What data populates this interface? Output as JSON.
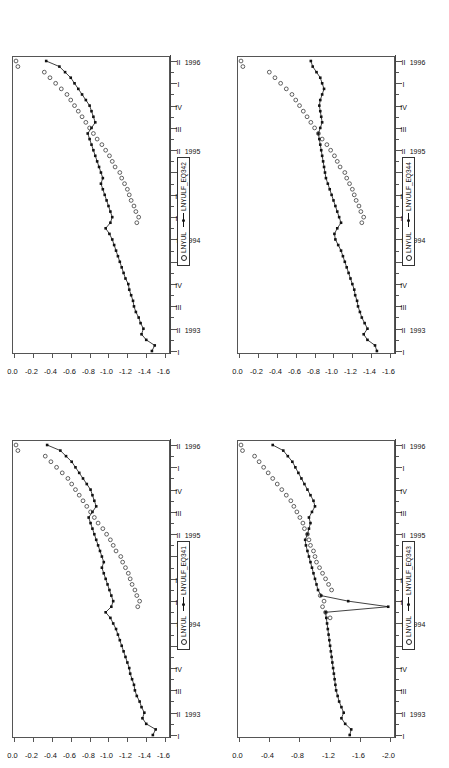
{
  "figure": {
    "background": "#ffffff",
    "panel_count": 4,
    "orientation": "rotated-90-ccw",
    "frame_color": "#555555"
  },
  "legend": {
    "series_observed": "LNYUL",
    "marker_observed": "open-circle",
    "marker_fitted": "line-with-filled-square"
  },
  "axis": {
    "x_quarters": [
      "I",
      "II",
      "III",
      "IV"
    ],
    "x_years": [
      "1993",
      "1994",
      "1995",
      "1996"
    ],
    "x_tick_labels": [
      "I",
      "II",
      "III",
      "IV",
      "I",
      "II",
      "III",
      "IV",
      "I",
      "II",
      "III",
      "IV",
      "I",
      "II"
    ],
    "x_year_positions": [
      1,
      5,
      9,
      13
    ]
  },
  "chart_data": [
    {
      "id": "panel-top-left",
      "type": "line",
      "title": "",
      "fitted_name": "LNYULF_EQ342",
      "observed_name": "LNYUL",
      "xlabel": "",
      "ylabel": "",
      "ylim": [
        -1.6,
        0.0
      ],
      "yticks": [
        "0.0",
        "-0.2",
        "-0.4",
        "-0.6",
        "-0.8",
        "-1.0",
        "-1.2",
        "-1.4",
        "-1.6"
      ],
      "ytick_values": [
        0.0,
        -0.2,
        -0.4,
        -0.6,
        -0.8,
        -1.0,
        -1.2,
        -1.4,
        -1.6
      ],
      "grid": false,
      "legend_position": "bottom-center",
      "x": [
        "1993Q1",
        "1993Q2",
        "1993Q3",
        "1993Q4",
        "1994Q1",
        "1994Q2",
        "1994Q3",
        "1994Q4",
        "1995Q1",
        "1995Q2",
        "1995Q3",
        "1995Q4",
        "1996Q1",
        "1996Q2"
      ],
      "n_points": 53,
      "series": [
        {
          "name": "LNYULF_EQ342",
          "marker": "filled-square-line",
          "values": [
            -1.44,
            -1.47,
            -1.38,
            -1.33,
            -1.35,
            -1.32,
            -1.3,
            -1.27,
            -1.25,
            -1.24,
            -1.22,
            -1.2,
            -1.19,
            -1.16,
            -1.14,
            -1.12,
            -1.1,
            -1.08,
            -1.06,
            -1.04,
            -1.02,
            -0.99,
            -0.95,
            -1.0,
            -1.02,
            -1.0,
            -0.98,
            -0.96,
            -0.94,
            -0.92,
            -0.9,
            -0.92,
            -0.9,
            -0.88,
            -0.86,
            -0.84,
            -0.82,
            -0.8,
            -0.78,
            -0.76,
            -0.8,
            -0.84,
            -0.82,
            -0.8,
            -0.78,
            -0.74,
            -0.7,
            -0.66,
            -0.62,
            -0.58,
            -0.52,
            -0.46,
            -0.32
          ]
        },
        {
          "name": "LNYUL",
          "marker": "open-circle",
          "values": [
            null,
            null,
            null,
            null,
            null,
            null,
            null,
            null,
            null,
            null,
            null,
            null,
            null,
            null,
            null,
            null,
            null,
            null,
            null,
            null,
            null,
            null,
            null,
            -1.28,
            -1.3,
            -1.27,
            -1.25,
            -1.22,
            -1.2,
            -1.18,
            -1.15,
            -1.12,
            -1.1,
            -1.05,
            -1.02,
            -0.99,
            -0.95,
            -0.91,
            -0.86,
            -0.82,
            -0.78,
            -0.74,
            -0.7,
            -0.66,
            -0.62,
            -0.58,
            -0.54,
            -0.48,
            -0.42,
            -0.36,
            -0.3,
            -0.02,
            0.0
          ]
        }
      ]
    },
    {
      "id": "panel-bottom-left",
      "type": "line",
      "title": "",
      "fitted_name": "LNYULF_EQ341",
      "observed_name": "LNYUL",
      "xlabel": "",
      "ylabel": "",
      "ylim": [
        -1.6,
        0.0
      ],
      "yticks": [
        "0.0",
        "-0.2",
        "-0.4",
        "-0.6",
        "-0.8",
        "-1.0",
        "-1.2",
        "-1.4",
        "-1.6"
      ],
      "ytick_values": [
        0.0,
        -0.2,
        -0.4,
        -0.6,
        -0.8,
        -1.0,
        -1.2,
        -1.4,
        -1.6
      ],
      "grid": false,
      "legend_position": "bottom-center",
      "n_points": 53,
      "series": [
        {
          "name": "LNYULF_EQ341",
          "marker": "filled-square-line",
          "values": [
            -1.45,
            -1.48,
            -1.38,
            -1.34,
            -1.36,
            -1.33,
            -1.31,
            -1.28,
            -1.26,
            -1.25,
            -1.23,
            -1.21,
            -1.2,
            -1.18,
            -1.16,
            -1.14,
            -1.12,
            -1.1,
            -1.08,
            -1.06,
            -1.03,
            -1.0,
            -0.95,
            -1.01,
            -1.03,
            -1.01,
            -0.99,
            -0.97,
            -0.95,
            -0.93,
            -0.91,
            -0.93,
            -0.91,
            -0.89,
            -0.87,
            -0.85,
            -0.83,
            -0.81,
            -0.79,
            -0.77,
            -0.81,
            -0.85,
            -0.83,
            -0.81,
            -0.79,
            -0.75,
            -0.71,
            -0.67,
            -0.63,
            -0.59,
            -0.53,
            -0.47,
            -0.33
          ]
        },
        {
          "name": "LNYUL",
          "marker": "open-circle",
          "values": [
            null,
            null,
            null,
            null,
            null,
            null,
            null,
            null,
            null,
            null,
            null,
            null,
            null,
            null,
            null,
            null,
            null,
            null,
            null,
            null,
            null,
            null,
            null,
            -1.29,
            -1.31,
            -1.28,
            -1.26,
            -1.23,
            -1.21,
            -1.19,
            -1.16,
            -1.13,
            -1.11,
            -1.06,
            -1.03,
            -1.0,
            -0.96,
            -0.92,
            -0.87,
            -0.83,
            -0.79,
            -0.75,
            -0.71,
            -0.67,
            -0.63,
            -0.59,
            -0.55,
            -0.49,
            -0.43,
            -0.37,
            -0.31,
            -0.02,
            0.0
          ]
        }
      ]
    },
    {
      "id": "panel-top-right",
      "type": "line",
      "title": "",
      "fitted_name": "LNYULF_EQ344",
      "observed_name": "LNYUL",
      "xlabel": "",
      "ylabel": "",
      "ylim": [
        -1.6,
        0.0
      ],
      "yticks": [
        "0.0",
        "-0.2",
        "-0.4",
        "-0.6",
        "-0.8",
        "-1.0",
        "-1.2",
        "-1.4",
        "-1.6"
      ],
      "ytick_values": [
        0.0,
        -0.2,
        -0.4,
        -0.6,
        -0.8,
        -1.0,
        -1.2,
        -1.4,
        -1.6
      ],
      "grid": false,
      "legend_position": "bottom-center",
      "n_points": 53,
      "series": [
        {
          "name": "LNYULF_EQ344",
          "marker": "filled-square-line",
          "values": [
            -1.44,
            -1.42,
            -1.34,
            -1.3,
            -1.34,
            -1.31,
            -1.28,
            -1.26,
            -1.24,
            -1.23,
            -1.21,
            -1.2,
            -1.18,
            -1.16,
            -1.14,
            -1.12,
            -1.1,
            -1.08,
            -1.06,
            -1.03,
            -1.0,
            -0.99,
            -1.02,
            -1.06,
            -1.04,
            -1.02,
            -1.0,
            -0.98,
            -0.96,
            -0.94,
            -0.92,
            -0.9,
            -0.89,
            -0.88,
            -0.87,
            -0.86,
            -0.85,
            -0.84,
            -0.83,
            -0.82,
            -0.84,
            -0.86,
            -0.85,
            -0.84,
            -0.83,
            -0.84,
            -0.86,
            -0.88,
            -0.86,
            -0.84,
            -0.8,
            -0.76,
            -0.74
          ]
        },
        {
          "name": "LNYUL",
          "marker": "open-circle",
          "values": [
            null,
            null,
            null,
            null,
            null,
            null,
            null,
            null,
            null,
            null,
            null,
            null,
            null,
            null,
            null,
            null,
            null,
            null,
            null,
            null,
            null,
            null,
            null,
            -1.28,
            -1.3,
            -1.27,
            -1.25,
            -1.22,
            -1.2,
            -1.18,
            -1.15,
            -1.12,
            -1.1,
            -1.05,
            -1.02,
            -0.99,
            -0.95,
            -0.91,
            -0.86,
            -0.82,
            -0.78,
            -0.74,
            -0.7,
            -0.66,
            -0.62,
            -0.58,
            -0.54,
            -0.48,
            -0.42,
            -0.36,
            -0.3,
            -0.02,
            0.0
          ]
        }
      ]
    },
    {
      "id": "panel-bottom-right",
      "type": "line",
      "title": "",
      "fitted_name": "LNYULF_EQ343",
      "observed_name": "LNYUL",
      "xlabel": "",
      "ylabel": "",
      "ylim": [
        -2.0,
        0.0
      ],
      "yticks": [
        "0.0",
        "-0.4",
        "-0.8",
        "-1.2",
        "-1.6",
        "-2.0"
      ],
      "ytick_values": [
        0.0,
        -0.4,
        -0.8,
        -1.2,
        -1.6,
        -2.0
      ],
      "grid": false,
      "legend_position": "bottom-center",
      "n_points": 53,
      "annotation": "Large downward spike to -1.95 at 1994 Q1",
      "series": [
        {
          "name": "LNYULF_EQ343",
          "marker": "filled-square-line",
          "values": [
            -1.44,
            -1.46,
            -1.38,
            -1.33,
            -1.36,
            -1.33,
            -1.3,
            -1.28,
            -1.26,
            -1.25,
            -1.24,
            -1.23,
            -1.22,
            -1.21,
            -1.2,
            -1.19,
            -1.18,
            -1.17,
            -1.16,
            -1.15,
            -1.14,
            -1.13,
            -1.12,
            -1.95,
            -1.42,
            -1.06,
            -1.02,
            -1.0,
            -0.98,
            -0.96,
            -0.94,
            -0.92,
            -0.9,
            -0.88,
            -0.86,
            -0.85,
            -0.88,
            -0.9,
            -0.92,
            -0.9,
            -0.94,
            -0.98,
            -0.96,
            -0.92,
            -0.88,
            -0.84,
            -0.8,
            -0.76,
            -0.72,
            -0.68,
            -0.62,
            -0.56,
            -0.42
          ]
        },
        {
          "name": "LNYUL",
          "marker": "open-circle",
          "values": [
            null,
            null,
            null,
            null,
            null,
            null,
            null,
            null,
            null,
            null,
            null,
            null,
            null,
            null,
            null,
            null,
            null,
            null,
            null,
            null,
            null,
            -1.18,
            -1.12,
            -1.08,
            -1.1,
            -1.05,
            -1.2,
            -1.16,
            -1.12,
            -1.08,
            -1.04,
            -1.0,
            -0.98,
            -0.96,
            -0.92,
            -0.9,
            -0.88,
            -0.84,
            -0.82,
            -0.78,
            -0.74,
            -0.7,
            -0.66,
            -0.6,
            -0.54,
            -0.48,
            -0.42,
            -0.36,
            -0.3,
            -0.24,
            -0.18,
            -0.02,
            0.0
          ]
        }
      ]
    }
  ]
}
